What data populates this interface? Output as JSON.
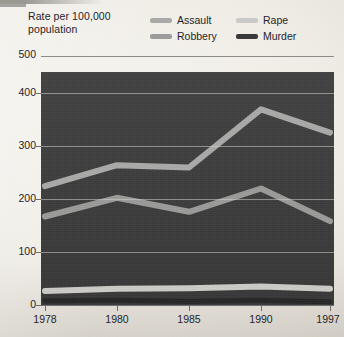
{
  "header": {
    "axis_title_line1": "Rate per 100,000",
    "axis_title_line2": "population"
  },
  "legend": {
    "items": [
      {
        "label": "Assault",
        "color": "#a9a9a8"
      },
      {
        "label": "Rape",
        "color": "#c9c9c7"
      },
      {
        "label": "Robbery",
        "color": "#9c9c9b"
      },
      {
        "label": "Murder",
        "color": "#3a3a3a"
      }
    ]
  },
  "axes": {
    "y_ticks": [
      "500",
      "400",
      "300",
      "200",
      "100",
      "0"
    ],
    "x_ticks": [
      "1978",
      "1980",
      "1985",
      "1990",
      "1997"
    ]
  },
  "colors": {
    "plot_background": "#3b3b3c",
    "paper": "#efece6",
    "gridline": "#d7d5d0",
    "text": "#24242a"
  },
  "chart_data": {
    "type": "line",
    "title": "Rate per 100,000 population",
    "xlabel": "",
    "ylabel": "Rate per 100,000 population",
    "categories": [
      "1978",
      "1980",
      "1985",
      "1990",
      "1997"
    ],
    "ylim": [
      0,
      500
    ],
    "y_ticks": [
      0,
      100,
      200,
      300,
      400,
      500
    ],
    "grid": true,
    "legend_position": "top-right",
    "series": [
      {
        "name": "Assault",
        "color": "#a9a9a8",
        "values": [
          255,
          300,
          295,
          420,
          370
        ]
      },
      {
        "name": "Robbery",
        "color": "#9c9c9b",
        "values": [
          190,
          230,
          200,
          250,
          180
        ]
      },
      {
        "name": "Rape",
        "color": "#c9c9c7",
        "values": [
          30,
          35,
          36,
          40,
          35
        ]
      },
      {
        "name": "Murder",
        "color": "#2b2b2b",
        "values": [
          9,
          10,
          8,
          10,
          7
        ]
      }
    ]
  }
}
